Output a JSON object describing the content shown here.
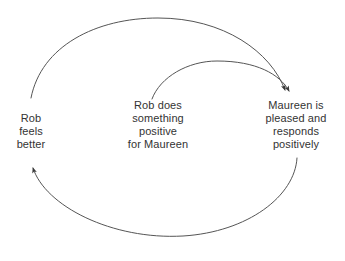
{
  "diagram": {
    "type": "causal-loop-diagram",
    "background_color": "#ffffff",
    "line_color": "#555555",
    "text_color": "#333333",
    "nodes": [
      {
        "id": "rob-feels-better",
        "text": "Rob\nfeels\nbetter",
        "lines": [
          "Rob",
          "feels",
          "better"
        ],
        "position": "left"
      },
      {
        "id": "rob-does-something-positive",
        "text": "Rob does\nsomething\npositive\nfor Maureen",
        "lines": [
          "Rob does",
          "something",
          "positive",
          "for Maureen"
        ],
        "position": "center"
      },
      {
        "id": "maureen-pleased",
        "text": "Maureen is\npleased and\nresponds\npositively",
        "lines": [
          "Maureen is",
          "pleased and",
          "responds",
          "positively"
        ],
        "position": "right"
      }
    ],
    "arrows": [
      {
        "id": "outer-top-arc",
        "from": "rob-feels-better",
        "to": "maureen-pleased",
        "shape": "arc-over-top",
        "arrowhead": "end"
      },
      {
        "id": "inner-top-arc",
        "from": "rob-does-something-positive",
        "to": "maureen-pleased",
        "shape": "arc-over-top",
        "arrowhead": "end"
      },
      {
        "id": "bottom-arc",
        "from": "maureen-pleased",
        "to": "rob-feels-better",
        "shape": "arc-under-bottom",
        "arrowhead": "end"
      }
    ]
  }
}
